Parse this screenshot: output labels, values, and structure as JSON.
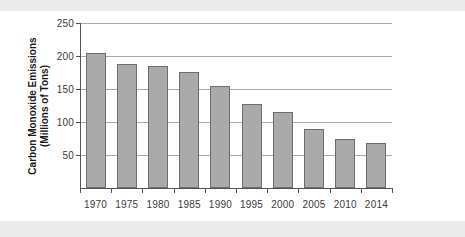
{
  "chart_data": {
    "type": "bar",
    "title": "",
    "xlabel": "",
    "ylabel": "Carbon Monoxide Emissions (Millions of Tons)",
    "ylabel_line1": "Carbon Monoxide Emissions",
    "ylabel_line2": "(Millions of Tons)",
    "categories": [
      "1970",
      "1975",
      "1980",
      "1985",
      "1990",
      "1995",
      "2000",
      "2005",
      "2010",
      "2014"
    ],
    "values": [
      204,
      188,
      185,
      176,
      154,
      127,
      115,
      89,
      74,
      68
    ],
    "ylim": [
      0,
      250
    ],
    "yticks": [
      50,
      100,
      150,
      200,
      250
    ],
    "ytick_labels": [
      "50",
      "100",
      "150",
      "200",
      "250"
    ],
    "grid": true,
    "legend": false,
    "bar_color": "#aaaaaa",
    "bar_border_color": "#6e6e6e",
    "axis_color": "#555555",
    "grid_color": "#aaaaaa",
    "background": "#ffffff",
    "band_color": "#ebebeb"
  }
}
